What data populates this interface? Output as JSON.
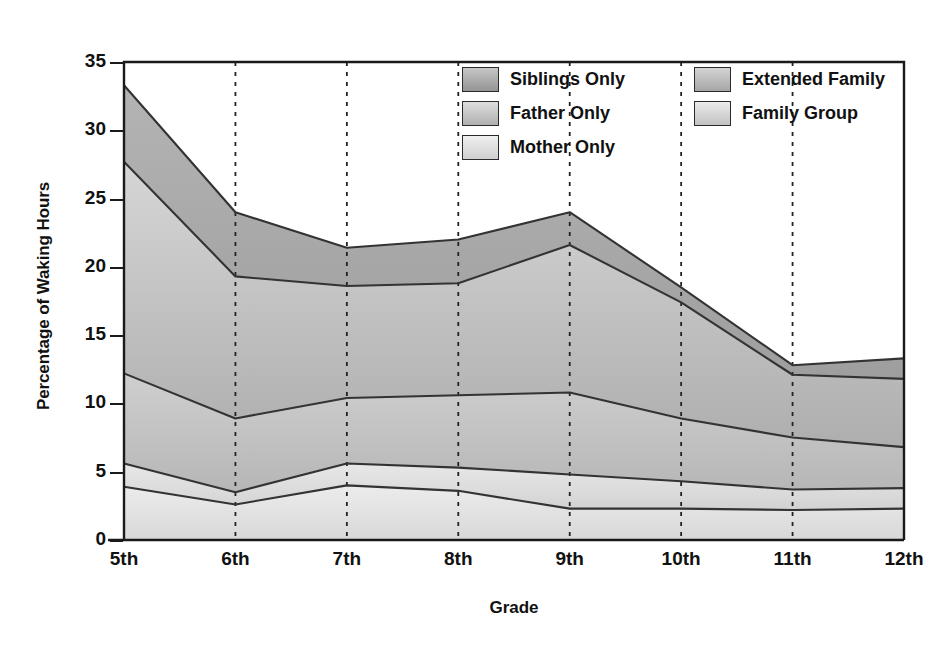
{
  "chart_data": {
    "type": "area",
    "title": "",
    "xlabel": "Grade",
    "ylabel": "Percentage of Waking Hours",
    "categories": [
      "5th",
      "6th",
      "7th",
      "8th",
      "9th",
      "10th",
      "11th",
      "12th"
    ],
    "ylim": [
      0,
      35
    ],
    "yticks": [
      0,
      5,
      10,
      15,
      20,
      25,
      30,
      35
    ],
    "stacked": true,
    "grid": "vertical-dashed-interior",
    "legend_position": "top-right-inside",
    "series": [
      {
        "name": "Family Group",
        "values": [
          3.9,
          2.6,
          4.0,
          3.6,
          2.3,
          2.3,
          2.2,
          2.3
        ]
      },
      {
        "name": "Mother Only",
        "values": [
          1.7,
          0.9,
          1.6,
          1.7,
          2.5,
          2.0,
          1.5,
          1.5
        ]
      },
      {
        "name": "Father Only",
        "values": [
          6.6,
          5.4,
          4.8,
          5.3,
          6.0,
          4.6,
          3.8,
          3.0
        ]
      },
      {
        "name": "Extended Family",
        "values": [
          15.5,
          10.4,
          8.2,
          8.2,
          10.8,
          8.5,
          4.6,
          5.0
        ]
      },
      {
        "name": "Siblings Only",
        "values": [
          5.6,
          4.7,
          2.8,
          3.2,
          2.4,
          1.1,
          0.7,
          1.5
        ]
      }
    ],
    "cumulative_tops": {
      "Family Group": [
        3.9,
        2.6,
        4.0,
        3.6,
        2.3,
        2.3,
        2.2,
        2.3
      ],
      "Mother Only": [
        5.6,
        3.5,
        5.6,
        5.3,
        4.8,
        4.3,
        3.7,
        3.8
      ],
      "Father Only": [
        12.2,
        8.9,
        10.4,
        10.6,
        10.8,
        8.9,
        7.5,
        6.8
      ],
      "Extended Family": [
        27.7,
        19.3,
        18.6,
        18.8,
        21.6,
        17.4,
        12.1,
        11.8
      ],
      "Siblings Only": [
        33.3,
        24.0,
        21.4,
        22.0,
        24.0,
        18.5,
        12.8,
        13.3
      ]
    },
    "colors": {
      "Siblings Only": "#a9a9a9",
      "Extended Family": "#b8b8b8",
      "Father Only": "#c4c4c4",
      "Mother Only": "#d6d6d6",
      "Family Group": "#e2e2e2",
      "line": "#333333",
      "axis": "#1a1a1a",
      "gridline": "#222222"
    }
  },
  "legend": {
    "items": [
      {
        "label": "Siblings Only",
        "color": "#a9a9a9"
      },
      {
        "label": "Father Only",
        "color": "#c4c4c4"
      },
      {
        "label": "Mother Only",
        "color": "#d9d9d9"
      },
      {
        "label": "Extended Family",
        "color": "#b5b5b5"
      },
      {
        "label": "Family Group",
        "color": "#dcdcdc"
      }
    ]
  }
}
